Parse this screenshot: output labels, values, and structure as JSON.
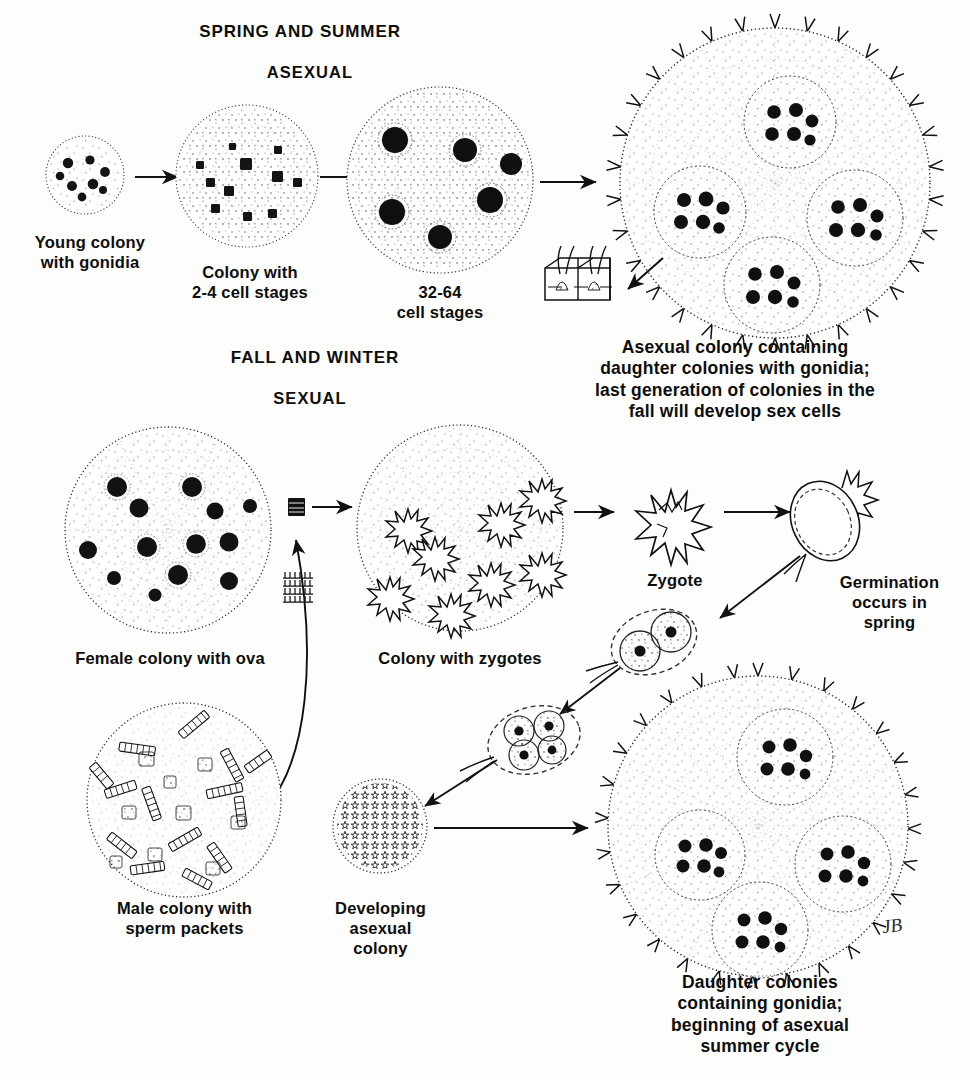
{
  "diagram": {
    "title_top": "SPRING AND SUMMER",
    "mode_top": "ASEXUAL",
    "title_bottom": "FALL AND WINTER",
    "mode_bottom": "SEXUAL",
    "signature": "JB",
    "ink_color": "#111111",
    "background_color": "#fdfdfc"
  },
  "labels": {
    "young_colony": "Young colony\nwith gonidia",
    "two_four_cell": "Colony with\n2-4 cell stages",
    "thirty_two_cell": "32-64\ncell stages",
    "asexual_colony": "Asexual colony containing\ndaughter colonies with gonidia;\nlast generation of colonies in the\nfall will develop sex cells",
    "female_colony": "Female colony with ova",
    "colony_zygotes": "Colony with zygotes",
    "zygote": "Zygote",
    "germination": "Germination\noccurs in\nspring",
    "male_colony": "Male colony with\nsperm packets",
    "developing_colony": "Developing\nasexual\ncolony",
    "daughter_colonies": "Daughter colonies\ncontaining gonidia;\nbeginning of asexual\nsummer cycle"
  },
  "figures": {
    "young_colony": {
      "name": "young-colony",
      "gonidia": 8,
      "radius": 39
    },
    "two_four_cell": {
      "name": "colony-2-4-cell",
      "gonidia": 11,
      "radius": 70
    },
    "thirty_two_cell": {
      "name": "colony-32-64-cell",
      "gonidia": 6,
      "radius": 92
    },
    "asexual_colony": {
      "name": "asexual-colony-with-daughters",
      "daughters": 4,
      "radius": 155,
      "flagella": true
    },
    "cell_detail": {
      "name": "cell-detail-inset",
      "cells": 2,
      "flagella_per_cell": 2
    },
    "female_colony": {
      "name": "female-colony",
      "ova": 13,
      "radius": 103
    },
    "zygote_colony": {
      "name": "colony-with-zygotes",
      "zygotes": 8,
      "radius": 103
    },
    "zygote": {
      "name": "zygote-spiny",
      "spikes": 18,
      "radius": 36
    },
    "germinating_zygote": {
      "name": "germinating-zygote",
      "radius": 32
    },
    "two_cell_stage": {
      "name": "two-cell-germination-stage",
      "cells": 2
    },
    "four_cell_stage": {
      "name": "four-cell-germination-stage",
      "cells": 4
    },
    "male_colony": {
      "name": "male-colony",
      "sperm_packets": 38,
      "radius": 97
    },
    "sperm_packet": {
      "name": "sperm-packet-icon",
      "rows": 4
    },
    "developing_colony": {
      "name": "developing-asexual-colony",
      "radius": 47
    },
    "daughter_colony_final": {
      "name": "daughter-colonies-final",
      "daughters": 4,
      "radius": 150,
      "flagella": true
    }
  },
  "arrows": [
    {
      "name": "arrow-young-to-24",
      "from": "young_colony",
      "to": "two_four_cell"
    },
    {
      "name": "arrow-24-to-3264",
      "from": "two_four_cell",
      "to": "thirty_two_cell"
    },
    {
      "name": "arrow-3264-to-asexual",
      "from": "thirty_two_cell",
      "to": "asexual_colony"
    },
    {
      "name": "arrow-asexual-to-detail",
      "from": "asexual_colony",
      "to": "cell_detail"
    },
    {
      "name": "arrow-female-to-zygote-colony",
      "from": "female_colony",
      "to": "zygote_colony"
    },
    {
      "name": "arrow-sperm-to-female",
      "from": "male_colony",
      "to": "female_colony"
    },
    {
      "name": "arrow-zygotecolony-to-zygote",
      "from": "zygote_colony",
      "to": "zygote"
    },
    {
      "name": "arrow-zygote-to-germination",
      "from": "zygote",
      "to": "germinating_zygote"
    },
    {
      "name": "arrow-germ-to-twocell",
      "from": "germinating_zygote",
      "to": "two_cell_stage"
    },
    {
      "name": "arrow-twocell-to-fourcell",
      "from": "two_cell_stage",
      "to": "four_cell_stage"
    },
    {
      "name": "arrow-fourcell-to-developing",
      "from": "four_cell_stage",
      "to": "developing_colony"
    },
    {
      "name": "arrow-developing-to-daughter",
      "from": "developing_colony",
      "to": "daughter_colony_final"
    }
  ]
}
